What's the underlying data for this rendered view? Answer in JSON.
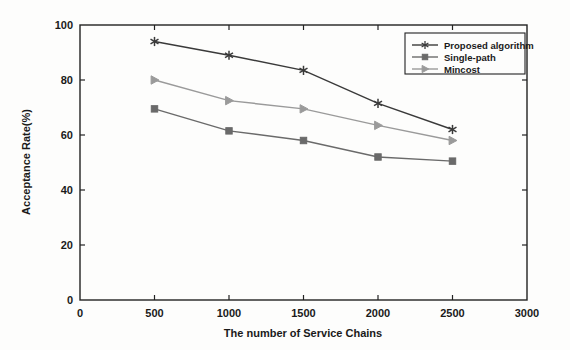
{
  "chart_data": {
    "type": "line",
    "title": "",
    "xlabel": "The number of Service Chains",
    "ylabel": "Acceptance Rate(%)",
    "xlim": [
      0,
      3000
    ],
    "ylim": [
      0,
      100
    ],
    "xticks": [
      0,
      500,
      1000,
      1500,
      2000,
      2500,
      3000
    ],
    "yticks": [
      0,
      20,
      40,
      60,
      80,
      100
    ],
    "xtick_labels": [
      "0",
      "500",
      "1000",
      "1500",
      "2000",
      "2500",
      "3000"
    ],
    "ytick_labels": [
      "0",
      "20",
      "40",
      "60",
      "80",
      "100"
    ],
    "grid": false,
    "legend_position": "upper right",
    "x": [
      500,
      1000,
      1500,
      2000,
      2500
    ],
    "series": [
      {
        "name": "Proposed algorithm",
        "marker": "star",
        "color": "#3a3a3a",
        "values": [
          94,
          89,
          83.5,
          71.5,
          62
        ]
      },
      {
        "name": "Single-path",
        "marker": "square",
        "color": "#6a6a6a",
        "values": [
          69.5,
          61.5,
          58,
          52,
          50.5
        ]
      },
      {
        "name": "Mincost",
        "marker": "triangle-right",
        "color": "#9a9a9a",
        "values": [
          80,
          72.5,
          69.5,
          63.5,
          58
        ]
      }
    ]
  },
  "axes": {
    "frame_color": "#222222",
    "background": "#fdfdfc"
  }
}
